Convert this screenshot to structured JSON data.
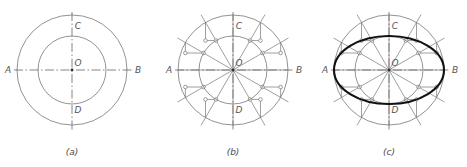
{
  "figure": {
    "panel_count": 3,
    "line_colors": {
      "construction": "#777777",
      "centerline": "#666666",
      "ellipse": "#111111",
      "text": "#555555",
      "background": "#ffffff"
    }
  },
  "panels": [
    {
      "id": "a",
      "caption": "(a)",
      "caption_x": 72,
      "caption_y": 155,
      "center": {
        "x": 72,
        "y": 70,
        "label": "O",
        "label_x": 78,
        "label_y": 66
      },
      "outer_circle_r": 55,
      "inner_circle_r": 34,
      "axis_labels": [
        {
          "name": "A",
          "x": 8,
          "y": 73
        },
        {
          "name": "B",
          "x": 138,
          "y": 73
        },
        {
          "name": "C",
          "x": 78,
          "y": 29
        },
        {
          "name": "D",
          "x": 78,
          "y": 113
        }
      ],
      "axis_h": {
        "x1": 14,
        "y1": 70,
        "x2": 132,
        "y2": 70
      },
      "axis_v": {
        "x1": 72,
        "y1": 12,
        "x2": 72,
        "y2": 130
      },
      "spokes": [],
      "show_marks": false,
      "show_ellipse": false
    },
    {
      "id": "b",
      "caption": "(b)",
      "caption_x": 233,
      "caption_y": 155,
      "center": {
        "x": 233,
        "y": 70,
        "label": "O",
        "label_x": 239,
        "label_y": 66
      },
      "outer_circle_r": 55,
      "inner_circle_r": 34,
      "axis_labels": [
        {
          "name": "A",
          "x": 169,
          "y": 73
        },
        {
          "name": "B",
          "x": 299,
          "y": 73
        },
        {
          "name": "C",
          "x": 239,
          "y": 29
        },
        {
          "name": "D",
          "x": 239,
          "y": 113
        }
      ],
      "axis_h": {
        "x1": 175,
        "y1": 70,
        "x2": 293,
        "y2": 70
      },
      "axis_v": {
        "x1": 233,
        "y1": 12,
        "x2": 233,
        "y2": 130
      },
      "spoke_angles_deg": [
        0,
        30,
        60,
        90,
        120,
        150,
        180,
        210,
        240,
        270,
        300,
        330
      ],
      "spoke_extend_r": 64,
      "show_marks": true,
      "show_ellipse": false
    },
    {
      "id": "c",
      "caption": "(c)",
      "caption_x": 389,
      "caption_y": 155,
      "center": {
        "x": 389,
        "y": 70,
        "label": "O",
        "label_x": 395,
        "label_y": 66
      },
      "outer_circle_r": 55,
      "inner_circle_r": 34,
      "axis_labels": [
        {
          "name": "A",
          "x": 325,
          "y": 73
        },
        {
          "name": "B",
          "x": 455,
          "y": 73
        },
        {
          "name": "C",
          "x": 395,
          "y": 29
        },
        {
          "name": "D",
          "x": 395,
          "y": 113
        }
      ],
      "axis_h": {
        "x1": 331,
        "y1": 70,
        "x2": 449,
        "y2": 70
      },
      "axis_v": {
        "x1": 389,
        "y1": 12,
        "x2": 389,
        "y2": 130
      },
      "spoke_angles_deg": [
        0,
        30,
        60,
        90,
        120,
        150,
        180,
        210,
        240,
        270,
        300,
        330
      ],
      "spoke_extend_r": 64,
      "show_marks": true,
      "show_ellipse": true,
      "ellipse_rx": 55,
      "ellipse_ry": 34
    }
  ],
  "chart_data": {
    "type": "diagram",
    "steps": [
      {
        "label": "(a)",
        "description": "Draw two concentric circles on major axis AB and minor axis CD about centre O"
      },
      {
        "label": "(b)",
        "description": "Divide circles with 12 radii at 30 degree intervals; drop verticals from outer circle and horizontals from inner circle"
      },
      {
        "label": "(c)",
        "description": "Join the 12 intersection points with a smooth curve to obtain the ellipse"
      }
    ],
    "major_axis_radius": 55,
    "minor_axis_radius": 34,
    "division_count": 12,
    "division_angle_deg": 30
  }
}
